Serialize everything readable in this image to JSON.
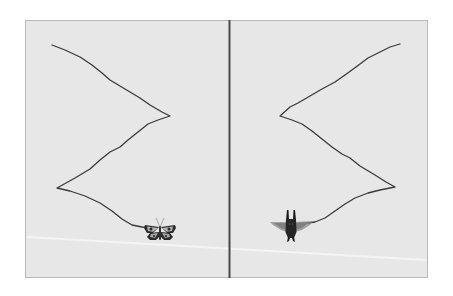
{
  "figure": {
    "panels": [
      {
        "id": "left",
        "creature": "butterfly",
        "path": [
          [
            52,
            45
          ],
          [
            65,
            50
          ],
          [
            80,
            57
          ],
          [
            92,
            65
          ],
          [
            102,
            73
          ],
          [
            110,
            80
          ],
          [
            125,
            89
          ],
          [
            140,
            98
          ],
          [
            150,
            105
          ],
          [
            162,
            112
          ],
          [
            170,
            116
          ],
          [
            158,
            120
          ],
          [
            148,
            124
          ],
          [
            138,
            132
          ],
          [
            128,
            140
          ],
          [
            120,
            147
          ],
          [
            110,
            152
          ],
          [
            100,
            160
          ],
          [
            90,
            169
          ],
          [
            75,
            178
          ],
          [
            57,
            188
          ],
          [
            70,
            191
          ],
          [
            85,
            196
          ],
          [
            100,
            203
          ],
          [
            112,
            211
          ],
          [
            122,
            219
          ],
          [
            132,
            225
          ],
          [
            142,
            227
          ],
          [
            148,
            228
          ]
        ]
      },
      {
        "id": "right",
        "creature": "winged-beetle",
        "path": [
          [
            400,
            44
          ],
          [
            390,
            47
          ],
          [
            378,
            53
          ],
          [
            368,
            58
          ],
          [
            356,
            67
          ],
          [
            345,
            75
          ],
          [
            335,
            82
          ],
          [
            322,
            89
          ],
          [
            310,
            96
          ],
          [
            298,
            103
          ],
          [
            290,
            107
          ],
          [
            280,
            116
          ],
          [
            292,
            120
          ],
          [
            302,
            124
          ],
          [
            312,
            131
          ],
          [
            322,
            139
          ],
          [
            332,
            147
          ],
          [
            342,
            154
          ],
          [
            350,
            158
          ],
          [
            360,
            166
          ],
          [
            375,
            175
          ],
          [
            386,
            182
          ],
          [
            395,
            187
          ],
          [
            380,
            190
          ],
          [
            368,
            193
          ],
          [
            355,
            198
          ],
          [
            345,
            204
          ],
          [
            335,
            211
          ],
          [
            325,
            218
          ],
          [
            315,
            222
          ],
          [
            308,
            223
          ]
        ]
      }
    ],
    "colors": {
      "background": "#ffffff",
      "panel": "#e7e7e7",
      "panel_border": "#b9b9b9",
      "divider": "#4a4a4a",
      "path": "#3a3a3a",
      "streak": "#f4f4f4"
    }
  }
}
